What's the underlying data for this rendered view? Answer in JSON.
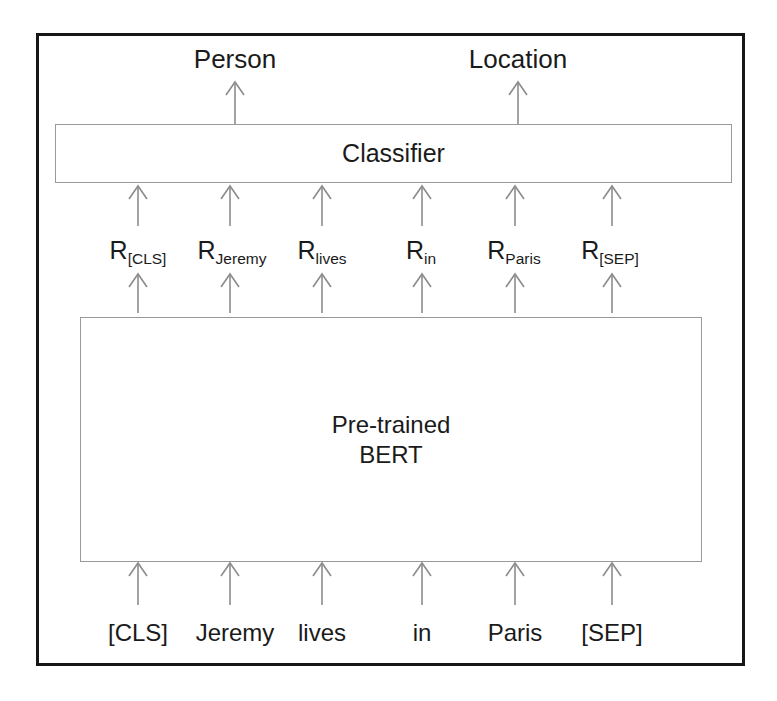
{
  "figure": {
    "outputs": [
      {
        "label": "Person",
        "x": 235
      },
      {
        "label": "Location",
        "x": 518
      }
    ],
    "classifier": {
      "label": "Classifier"
    },
    "encoder": {
      "label": "Pre-trained\nBERT",
      "line1": "Pre-trained",
      "line2": "BERT"
    },
    "representations": [
      {
        "base": "R",
        "sub": "[CLS]",
        "x": 138
      },
      {
        "base": "R",
        "sub": "Jeremy",
        "x": 232
      },
      {
        "base": "R",
        "sub": "lives",
        "x": 322
      },
      {
        "base": "R",
        "sub": "in",
        "x": 421
      },
      {
        "base": "R",
        "sub": "Paris",
        "x": 514
      },
      {
        "base": "R",
        "sub": "[SEP]",
        "x": 610
      }
    ],
    "input_tokens": [
      {
        "label": "[CLS]",
        "x": 138
      },
      {
        "label": "Jeremy",
        "x": 235
      },
      {
        "label": "lives",
        "x": 322
      },
      {
        "label": "in",
        "x": 422
      },
      {
        "label": "Paris",
        "x": 515
      },
      {
        "label": "[SEP]",
        "x": 612
      }
    ],
    "colors": {
      "frame": "#161616",
      "box_border": "#9a9a9a",
      "arrow": "#8c8c8c",
      "text": "#1a1a1a",
      "background": "#ffffff"
    }
  }
}
